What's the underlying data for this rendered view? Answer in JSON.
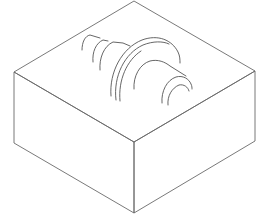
{
  "figure": {
    "description": "Isometric line drawing of a rectangular block with a stepped shaft (cone, collar, cylinder) cavity impression on the top face",
    "colors": {
      "background": "#ffffff",
      "edge_stroke": "#6a6a6a",
      "arc_stroke": "#555555"
    },
    "box": {
      "top_face": [
        [
          134,
          1
        ],
        [
          255,
          71
        ],
        [
          134,
          142
        ],
        [
          14,
          72
        ]
      ],
      "left_face": [
        [
          14,
          72
        ],
        [
          134,
          142
        ],
        [
          134,
          213
        ],
        [
          14,
          143
        ]
      ],
      "right_face": [
        [
          134,
          142
        ],
        [
          255,
          71
        ],
        [
          255,
          141
        ],
        [
          134,
          213
        ]
      ]
    },
    "features": [
      "cone-arcs",
      "collar-arcs",
      "shaft-arcs"
    ]
  }
}
